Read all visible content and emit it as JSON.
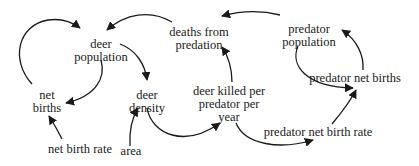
{
  "diagram": {
    "type": "causal-loop-diagram",
    "nodes": {
      "deer_population": {
        "line1": "deer",
        "line2": "population"
      },
      "deaths_from_predation": {
        "line1": "deaths from",
        "line2": "predation"
      },
      "predator_population": {
        "line1": "predator",
        "line2": "population"
      },
      "net_births": {
        "line1": "net",
        "line2": "births"
      },
      "deer_density": {
        "line1": "deer",
        "line2": "density"
      },
      "deer_killed_per_predator_per_year": {
        "line1": "deer killed per",
        "line2": "predator per",
        "line3": "year"
      },
      "predator_net_births": {
        "line1": "predator net births"
      },
      "net_birth_rate": {
        "line1": "net birth rate"
      },
      "area": {
        "line1": "area"
      },
      "predator_net_birth_rate": {
        "line1": "predator net birth rate"
      }
    },
    "edges": [
      {
        "from": "net births",
        "to": "deer population"
      },
      {
        "from": "deer population",
        "to": "net births"
      },
      {
        "from": "net birth rate",
        "to": "net births"
      },
      {
        "from": "deaths from predation",
        "to": "deer population"
      },
      {
        "from": "deer population",
        "to": "deer density"
      },
      {
        "from": "area",
        "to": "deer density"
      },
      {
        "from": "deer density",
        "to": "deer killed per predator per year"
      },
      {
        "from": "deer killed per predator per year",
        "to": "deaths from predation"
      },
      {
        "from": "predator population",
        "to": "deaths from predation"
      },
      {
        "from": "deer killed per predator per year",
        "to": "predator net birth rate"
      },
      {
        "from": "predator net birth rate",
        "to": "predator net births"
      },
      {
        "from": "predator population",
        "to": "predator net births"
      },
      {
        "from": "predator net births",
        "to": "predator population"
      }
    ],
    "colors": {
      "ink": "#1a1a1a",
      "background": "#ffffff"
    }
  }
}
